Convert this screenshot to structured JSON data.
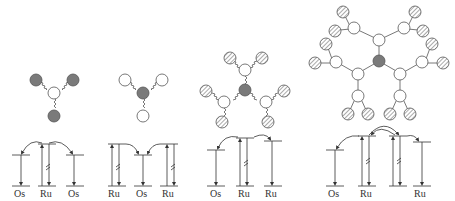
{
  "figure": {
    "panels": [
      {
        "id": "panel-1",
        "structure": {
          "core": "white",
          "periphery": "gray",
          "peripheral_count": 3
        },
        "energy_labels": [
          "Os",
          "Ru",
          "Os"
        ]
      },
      {
        "id": "panel-2",
        "structure": {
          "core": "gray",
          "periphery": "white",
          "peripheral_count": 3
        },
        "energy_labels": [
          "Ru",
          "Os",
          "Ru"
        ]
      },
      {
        "id": "panel-3",
        "structure": {
          "core": "gray",
          "intermediate": "white",
          "periphery": "hatched",
          "generation": 1
        },
        "energy_labels": [
          "Os",
          "Ru",
          "Ru"
        ]
      },
      {
        "id": "panel-4",
        "structure": {
          "core": "gray",
          "intermediate": "white",
          "periphery": "hatched",
          "generation": 2
        },
        "energy_labels": [
          "Os",
          "Ru",
          "",
          "Ru"
        ]
      }
    ],
    "colors": {
      "gray_node": "#7a7a7a",
      "line": "#444444",
      "white_node": "#ffffff"
    }
  }
}
